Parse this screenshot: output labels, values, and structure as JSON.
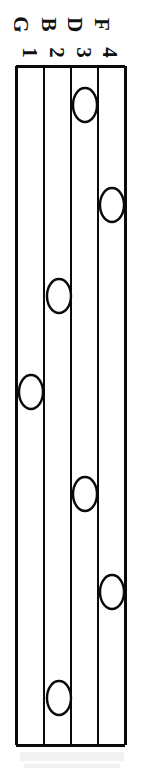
{
  "diagram": {
    "orientation": "vertical",
    "stroke_color": "#0a0a0a",
    "background_color": "#ffffff",
    "grid": {
      "left": 16,
      "right": 125,
      "top": 66,
      "bottom": 745,
      "line_x_positions": [
        16,
        44,
        71,
        98,
        125
      ],
      "lane_count": 4,
      "border_width": 3,
      "inner_line_width": 2
    },
    "lanes": [
      {
        "id": "lane-1",
        "note": "G",
        "number": "1",
        "label": "G 1",
        "center_x": 30,
        "label_x": 14
      },
      {
        "id": "lane-2",
        "note": "B",
        "number": "2",
        "label": "B 2",
        "center_x": 57,
        "label_x": 42
      },
      {
        "id": "lane-3",
        "note": "D",
        "number": "3",
        "label": "D 3",
        "center_x": 84,
        "label_x": 69
      },
      {
        "id": "lane-4",
        "note": "F",
        "number": "4",
        "label": "F 4",
        "center_x": 111,
        "label_x": 96
      }
    ],
    "notes": [
      {
        "id": "note-1",
        "lane": 3,
        "lane_label": "D 3",
        "cx": 85,
        "cy": 105,
        "rx": 12,
        "ry": 17
      },
      {
        "id": "note-2",
        "lane": 4,
        "lane_label": "F 4",
        "cx": 112,
        "cy": 205,
        "rx": 12,
        "ry": 17
      },
      {
        "id": "note-3",
        "lane": 2,
        "lane_label": "B 2",
        "cx": 59,
        "cy": 296,
        "rx": 12,
        "ry": 17
      },
      {
        "id": "note-4",
        "lane": 1,
        "lane_label": "G 1",
        "cx": 31,
        "cy": 392,
        "rx": 12,
        "ry": 17
      },
      {
        "id": "note-5",
        "lane": 3,
        "lane_label": "D 3",
        "cx": 85,
        "cy": 494,
        "rx": 12,
        "ry": 17
      },
      {
        "id": "note-6",
        "lane": 4,
        "lane_label": "F 4",
        "cx": 112,
        "cy": 592,
        "rx": 12,
        "ry": 17
      },
      {
        "id": "note-7",
        "lane": 2,
        "lane_label": "B 2",
        "cx": 59,
        "cy": 698,
        "rx": 12,
        "ry": 17
      }
    ]
  }
}
